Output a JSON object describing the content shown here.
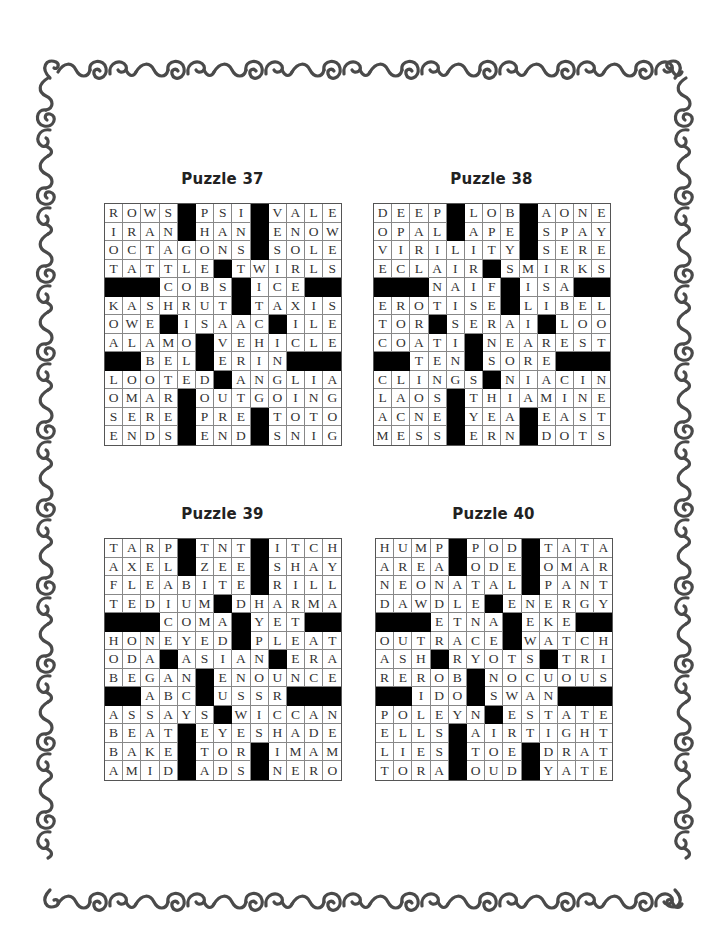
{
  "page": {
    "border_color": "#4a4a4a",
    "background": "#ffffff"
  },
  "puzzles": [
    {
      "title": "Puzzle 37",
      "rows": [
        "ROWS#PSI#VALE",
        "IRAN#HAN#ENOW",
        "OCTAGONS#SOLE",
        "TATTLE#TWIRLS",
        "###COBS#ICE##",
        "KASHRUT#TAXIS",
        "OWE#ISAAC#ILE",
        "ALAMO#VEHICLE",
        "##BEL#ERIN###",
        "LOOTED#ANGLIA",
        "OMAR#OUTGOING",
        "SERE#PRE#TOTO",
        "ENDS#END#SNIG"
      ]
    },
    {
      "title": "Puzzle 38",
      "rows": [
        "DEEP#LOB#AONE",
        "OPAL#APE#SPAY",
        "VIRILITY#SERE",
        "ECLAIR#SMIRKS",
        "###NAIF#ISA##",
        "EROTISE#LIBEL",
        "TOR#SERAI#LOO",
        "COATI#NEAREST",
        "##TEN#SORE###",
        "CLINGS#NIACIN",
        "LAOS#THIAMINE",
        "ACNE#YEA#EAST",
        "MESS#ERN#DOTS"
      ]
    },
    {
      "title": "Puzzle 39",
      "rows": [
        "TARP#TNT#ITCH",
        "AXEL#ZEE#SHAY",
        "FLEABITE#RILL",
        "TEDIUM#DHARMA",
        "###COMA#YET##",
        "HONEYED#PLEAT",
        "ODA#ASIAN#ERA",
        "BEGAN#ENOUNCE",
        "##ABC#USSR###",
        "ASSAYS#WICCAN",
        "BEAT#EYESHADE",
        "BAKE#TOR#IMAM",
        "AMID#ADS#NERO"
      ]
    },
    {
      "title": "Puzzle 40",
      "rows": [
        "HUMP#POD#TATA",
        "AREA#ODE#OMAR",
        "NEONATAL#PANT",
        "DAWDLE#ENERGY",
        "###ETNA#EKE##",
        "OUTRACE#WATCH",
        "ASH#RYOTS#TRI",
        "REROB#NOCUOUS",
        "##IDO#SWAN###",
        "POLEYN#ESTATE",
        "ELLS#AIRTIGHT",
        "LIES#TOE#DRAT",
        "TORA#OUD#YATE"
      ]
    }
  ]
}
